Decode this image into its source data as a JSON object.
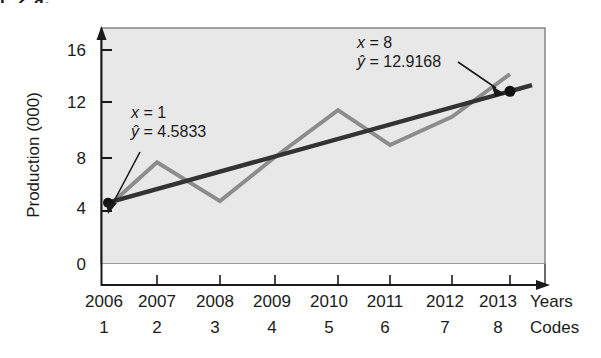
{
  "caption_fragment": "E 2  a.",
  "chart_data": {
    "type": "line",
    "title": "",
    "xlabel": "Years",
    "ylabel": "Production (000)",
    "x_secondary_label": "Codes",
    "categories": [
      "2006",
      "2007",
      "2008",
      "2009",
      "2010",
      "2011",
      "2012",
      "2013"
    ],
    "codes": [
      "1",
      "2",
      "3",
      "4",
      "5",
      "6",
      "7",
      "8"
    ],
    "ylim": [
      0,
      17.5
    ],
    "y_ticks": [
      "0",
      "4",
      "8",
      "12",
      "16"
    ],
    "y_tick_values": [
      0,
      4,
      8,
      12,
      16
    ],
    "grid": false,
    "legend": "none",
    "series": [
      {
        "name": "Production",
        "role": "actual-data",
        "color": "#8c8c8c",
        "values": [
          4.3,
          7.6,
          4.7,
          8.0,
          11.5,
          8.9,
          11.0,
          14.2
        ]
      },
      {
        "name": "Trend line",
        "role": "regression-line",
        "color": "#333333",
        "values": [
          4.5833,
          5.7738,
          6.9643,
          8.1548,
          9.3453,
          10.5358,
          11.7263,
          12.9168
        ]
      }
    ],
    "markers": [
      {
        "name": "start-point",
        "x_code": 1,
        "y": 4.5833
      },
      {
        "name": "end-point",
        "x_code": 8,
        "y": 12.9168
      }
    ],
    "annotations": [
      {
        "name": "annotation-start",
        "line1_var": "x",
        "line1_rest": " = 1",
        "line2_var": "ŷ",
        "line2_rest": " = 4.5833"
      },
      {
        "name": "annotation-end",
        "line1_var": "x",
        "line1_rest": " = 8",
        "line2_var": "ŷ",
        "line2_rest": " = 12.9168"
      }
    ]
  },
  "colors": {
    "plot_background": "#e8e8e8",
    "data_line": "#8c8c8c",
    "trend_line": "#333333",
    "axis": "#1a1a1a"
  }
}
